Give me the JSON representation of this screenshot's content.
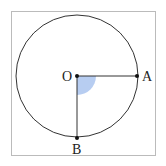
{
  "diagram": {
    "type": "circle-with-radii",
    "points": {
      "O": {
        "label": "O",
        "x": 77,
        "y": 76
      },
      "A": {
        "label": "A",
        "x": 137,
        "y": 76
      },
      "B": {
        "label": "B",
        "x": 77,
        "y": 138
      }
    },
    "circle": {
      "cx": 77,
      "cy": 76,
      "r": 61
    },
    "angle_marker": {
      "vertex": "O",
      "from": "A",
      "to": "B",
      "radius": 19,
      "fill": "#aac4ef"
    },
    "colors": {
      "stroke": "#333333",
      "frame": "#bbbbbb",
      "sector": "#aac4ef"
    }
  }
}
